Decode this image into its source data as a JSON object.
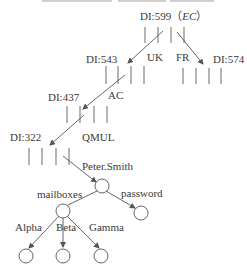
{
  "diagram": {
    "type": "directory-tree",
    "colors": {
      "line": "#555555",
      "text": "#3a3a3a",
      "background": "#ffffff"
    },
    "dsa_nodes": [
      {
        "id": "dsa599",
        "label": "DI:599",
        "suffix": "（EC）",
        "suffix_italic": "EC"
      },
      {
        "id": "dsa543",
        "label": "DI:543"
      },
      {
        "id": "dsa574",
        "label": "DI:574"
      },
      {
        "id": "dsa437",
        "label": "DI:437"
      },
      {
        "id": "dsa322",
        "label": "DI:322"
      }
    ],
    "edges": [
      {
        "from": "dsa599",
        "to": "dsa543",
        "label": "UK"
      },
      {
        "from": "dsa599",
        "to": "dsa574",
        "label": "FR"
      },
      {
        "from": "dsa543",
        "to": "dsa437",
        "label": "AC"
      },
      {
        "from": "dsa437",
        "to": "dsa322",
        "label": "QMUL"
      },
      {
        "from": "dsa322",
        "to": "user",
        "label": "Peter.Smith"
      },
      {
        "from": "user",
        "to": "mailboxes",
        "label": "mailboxes"
      },
      {
        "from": "user",
        "to": "password",
        "label": "password"
      },
      {
        "from": "mailboxes",
        "to": "alpha",
        "label": "Alpha"
      },
      {
        "from": "mailboxes",
        "to": "beta",
        "label": "Beta"
      },
      {
        "from": "mailboxes",
        "to": "gamma",
        "label": "Gamma"
      }
    ]
  }
}
